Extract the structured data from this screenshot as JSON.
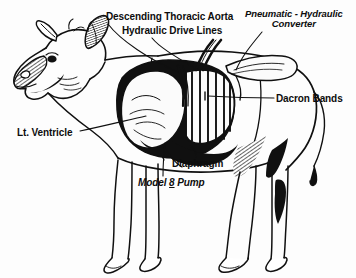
{
  "figure": {
    "background_color": "#fdfdfd",
    "ink_color": "#101010"
  },
  "labels": {
    "descending_thoracic_aorta": "Descending Thoracic Aorta",
    "hydraulic_drive_lines": "Hydraulic Drive Lines",
    "pneumatic_hydraulic_converter_line1": "Pneumatic - Hydraulic",
    "pneumatic_hydraulic_converter_line2": "Converter",
    "dacron_bands": "Dacron Bands",
    "lt_ventricle": "Lt. Ventricle",
    "diaphragm": "Diaphragm",
    "model_pump_prefix": "Model ",
    "model_pump_number": "8",
    "model_pump_suffix": " Pump"
  }
}
